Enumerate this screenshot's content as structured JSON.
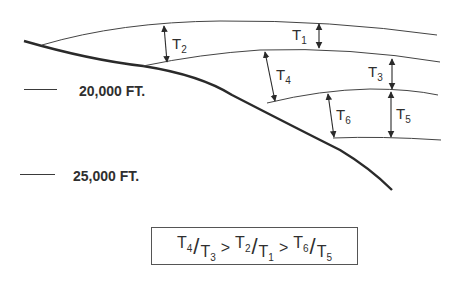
{
  "diagram": {
    "type": "cross-section",
    "depth_markers": [
      {
        "label": "20,000 FT."
      },
      {
        "label": "25,000 FT."
      }
    ],
    "thickness_labels": [
      {
        "id": "T1",
        "base": "T",
        "sub": "1"
      },
      {
        "id": "T2",
        "base": "T",
        "sub": "2"
      },
      {
        "id": "T3",
        "base": "T",
        "sub": "3"
      },
      {
        "id": "T4",
        "base": "T",
        "sub": "4"
      },
      {
        "id": "T5",
        "base": "T",
        "sub": "5"
      },
      {
        "id": "T6",
        "base": "T",
        "sub": "6"
      }
    ],
    "formula": {
      "terms": [
        {
          "num_base": "T",
          "num_sub": "4",
          "den_base": "T",
          "den_sub": "3"
        },
        {
          "num_base": "T",
          "num_sub": "2",
          "den_base": "T",
          "den_sub": "1"
        },
        {
          "num_base": "T",
          "num_sub": "6",
          "den_base": "T",
          "den_sub": "5"
        }
      ],
      "operator": ">",
      "slash": "/"
    },
    "colors": {
      "line": "#2a2a2a",
      "background": "#ffffff"
    }
  }
}
